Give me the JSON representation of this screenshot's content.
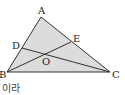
{
  "diagram": {
    "type": "triangle",
    "fill": "#dcdcdc",
    "stroke": "#333333",
    "points": {
      "A": {
        "label": "A",
        "x": 41,
        "y": 17
      },
      "B": {
        "label": "B",
        "x": 7,
        "y": 72
      },
      "C": {
        "label": "C",
        "x": 110,
        "y": 72
      },
      "D": {
        "label": "D",
        "x": 22,
        "y": 48
      },
      "E": {
        "label": "E",
        "x": 71,
        "y": 42
      },
      "O": {
        "label": "O",
        "x": 45,
        "y": 54
      }
    },
    "segments": [
      "AB",
      "BC",
      "CA",
      "BE",
      "CD"
    ]
  },
  "caption": {
    "text": "이라"
  }
}
